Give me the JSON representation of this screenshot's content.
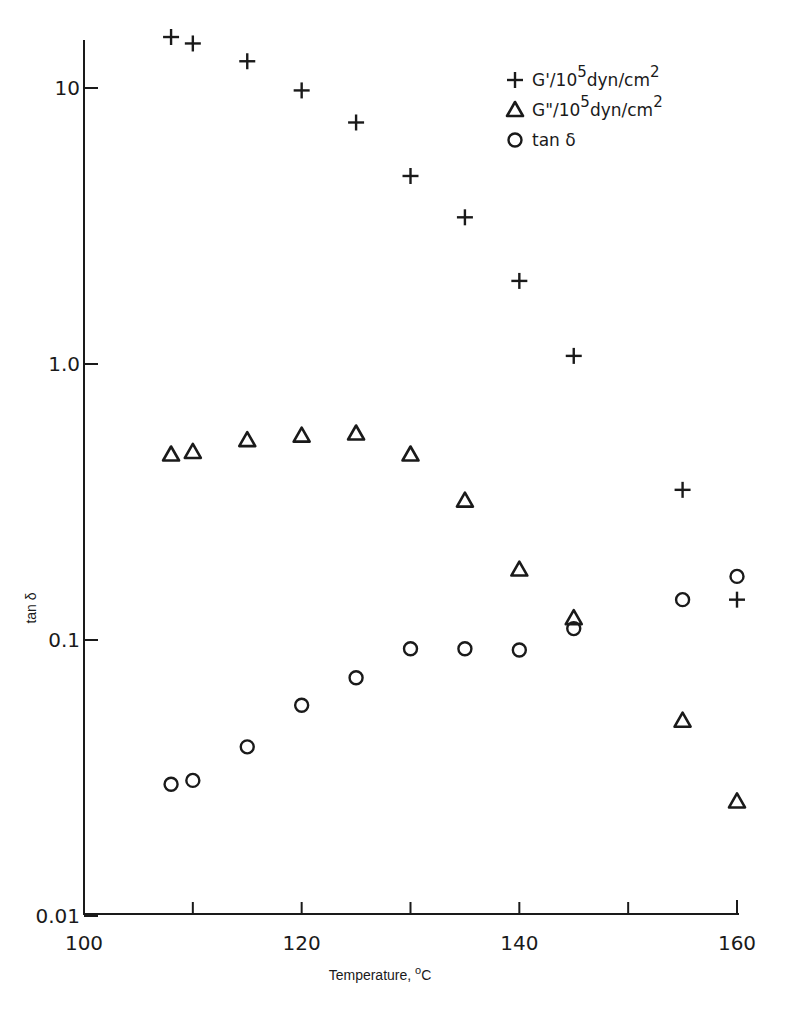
{
  "chart_data": {
    "type": "scatter",
    "title": "",
    "xlabel": "Temperature, °C",
    "ylabel": "tan δ",
    "xlim": [
      100,
      160
    ],
    "ylim": [
      0.01,
      20
    ],
    "yscale": "log",
    "grid": false,
    "legend_position": "upper right",
    "x_ticks": [
      100,
      110,
      120,
      130,
      140,
      150,
      160
    ],
    "x_tick_labels": [
      "100",
      "120",
      "140",
      "160"
    ],
    "y_ticks": [
      10,
      1.0,
      0.1,
      0.01
    ],
    "y_tick_labels": [
      "10",
      "1.0",
      "0.1",
      "0.01"
    ],
    "series": [
      {
        "name": "G'/10^5 dyn/cm^2",
        "marker": "plus",
        "x": [
          108,
          110,
          115,
          120,
          125,
          130,
          135,
          140,
          145,
          155,
          160
        ],
        "values": [
          15.3,
          14.5,
          12.5,
          9.8,
          7.5,
          4.8,
          3.4,
          2.0,
          1.07,
          0.35,
          0.14
        ]
      },
      {
        "name": "G\"/10^5 dyn/cm^2",
        "marker": "triangle",
        "x": [
          108,
          110,
          115,
          120,
          125,
          130,
          135,
          140,
          145,
          155,
          160
        ],
        "values": [
          0.47,
          0.48,
          0.53,
          0.55,
          0.56,
          0.47,
          0.32,
          0.18,
          0.12,
          0.051,
          0.026
        ]
      },
      {
        "name": "tan δ",
        "marker": "circle",
        "x": [
          108,
          110,
          115,
          120,
          125,
          130,
          135,
          140,
          145,
          155,
          160
        ],
        "values": [
          0.03,
          0.031,
          0.041,
          0.058,
          0.073,
          0.093,
          0.093,
          0.092,
          0.11,
          0.14,
          0.17
        ]
      }
    ],
    "legend": [
      {
        "marker": "plus",
        "label_main": "G'/10",
        "label_sup": "5",
        "label_unit": "dyn/cm",
        "label_sup2": "2"
      },
      {
        "marker": "triangle",
        "label_main": "G\"/10",
        "label_sup": "5",
        "label_unit": "dyn/cm",
        "label_sup2": "2"
      },
      {
        "marker": "circle",
        "label_main": "tan δ",
        "label_sup": "",
        "label_unit": "",
        "label_sup2": ""
      }
    ]
  },
  "axes": {
    "x_title": "Temperature, ",
    "x_title_sup": "o",
    "x_title_end": "C",
    "y_title": "tan δ"
  }
}
